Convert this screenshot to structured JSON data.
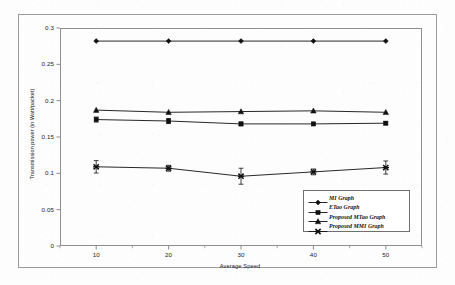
{
  "chart_data": {
    "type": "line",
    "title": "",
    "xlabel": "Average Speed",
    "ylabel": "Transmission power  (in Watt/packet)",
    "x": [
      10,
      20,
      30,
      40,
      50
    ],
    "xtick_labels": [
      "10",
      "20",
      "30",
      "40",
      "50"
    ],
    "ytick_labels": [
      "0",
      "0.05",
      "0.1",
      "0.15",
      "0.2",
      "0.25",
      "0.3"
    ],
    "ytick_values": [
      0,
      0.05,
      0.1,
      0.15,
      0.2,
      0.25,
      0.3
    ],
    "xlim": [
      5,
      55
    ],
    "ylim": [
      0,
      0.3
    ],
    "grid": false,
    "legend_position": "lower-right",
    "series": [
      {
        "name": "MI Graph",
        "marker": "diamond",
        "color": "#101010",
        "values": [
          0.282,
          0.282,
          0.282,
          0.282,
          0.282
        ],
        "errors": [
          0,
          0,
          0,
          0,
          0
        ]
      },
      {
        "name": "ETao Graph",
        "marker": "square",
        "color": "#101010",
        "values": [
          0.174,
          0.172,
          0.168,
          0.168,
          0.169
        ],
        "errors": [
          0.0035,
          0.0035,
          0.0025,
          0.002,
          0.002
        ]
      },
      {
        "name": "Proposed MTao Graph",
        "marker": "triangle",
        "color": "#101010",
        "values": [
          0.187,
          0.184,
          0.185,
          0.186,
          0.184
        ],
        "errors": [
          0,
          0,
          0,
          0,
          0
        ]
      },
      {
        "name": "Proposed MMI Graph",
        "marker": "cross",
        "color": "#101010",
        "values": [
          0.109,
          0.107,
          0.096,
          0.102,
          0.108
        ],
        "errors": [
          0.0085,
          0.004,
          0.011,
          0.004,
          0.009
        ]
      }
    ]
  }
}
